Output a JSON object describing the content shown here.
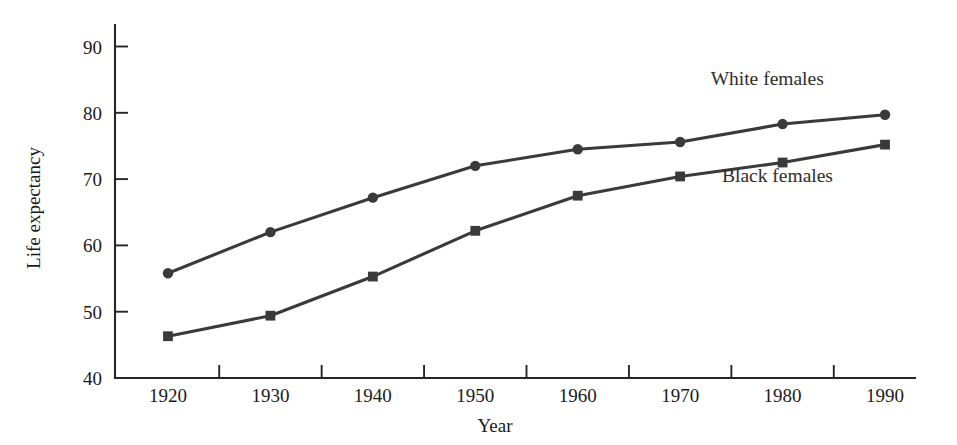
{
  "chart_data": {
    "type": "line",
    "title": "",
    "xlabel": "Year",
    "ylabel": "Life expectancy",
    "x": [
      1920,
      1930,
      1940,
      1950,
      1960,
      1970,
      1980,
      1990
    ],
    "xtick_labels": [
      "1920",
      "1930",
      "1940",
      "1950",
      "1960",
      "1970",
      "1980",
      "1990"
    ],
    "ytick_labels": [
      "40",
      "50",
      "60",
      "70",
      "80",
      "90"
    ],
    "yticks": [
      40,
      50,
      60,
      70,
      80,
      90
    ],
    "xlim": [
      1915,
      1997
    ],
    "ylim": [
      40,
      94
    ],
    "grid": false,
    "legend_position": "inline-annotation",
    "series": [
      {
        "name": "White females",
        "marker": "circle",
        "color": "#3a3a3a",
        "values": [
          55.8,
          62.0,
          67.2,
          72.0,
          74.5,
          75.6,
          78.3,
          79.7
        ],
        "annotation": "White females"
      },
      {
        "name": "Black females",
        "marker": "square",
        "color": "#3a3a3a",
        "values": [
          46.3,
          49.4,
          55.3,
          62.2,
          67.5,
          70.4,
          72.5,
          75.2
        ],
        "annotation": "Black females"
      }
    ],
    "annotations": [
      {
        "text": "White females",
        "x": 1978.5,
        "y": 84.2
      },
      {
        "text": "Black females",
        "x": 1979.5,
        "y": 69.6
      }
    ]
  },
  "axes": {
    "y_title": "Life expectancy",
    "x_title": "Year"
  },
  "colors": {
    "background": "#ffffff",
    "ink": "#1a1a1a",
    "series": "#3a3a3a",
    "axis": "#262626"
  }
}
